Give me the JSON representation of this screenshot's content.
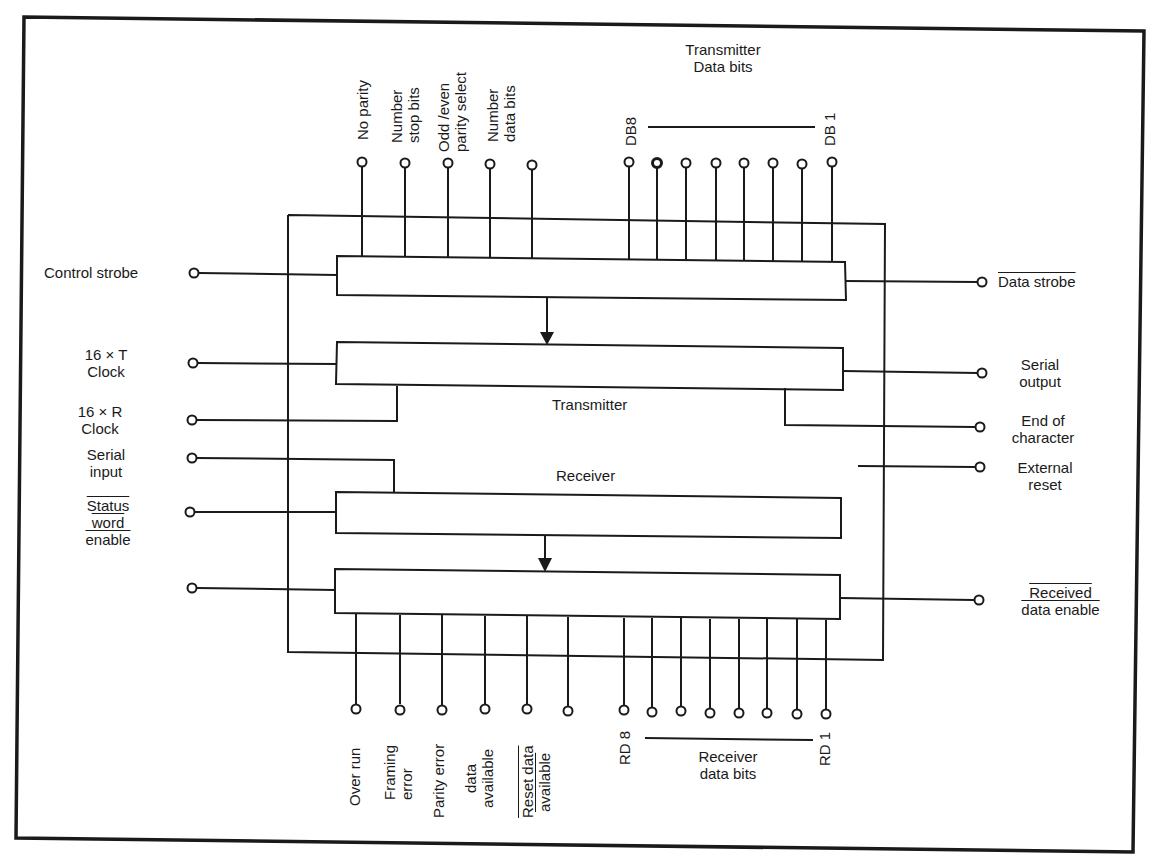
{
  "diagram": {
    "colors": {
      "line": "#1a1a1a",
      "background": "#ffffff"
    },
    "blocks": {
      "transmitter_label": "Transmitter",
      "receiver_label": "Receiver"
    },
    "top_control_pins": [
      {
        "lines": [
          "No parity"
        ]
      },
      {
        "lines": [
          "Number",
          "stop bits"
        ]
      },
      {
        "lines": [
          "Odd /even",
          "parity select"
        ]
      },
      {
        "lines": [
          "Number",
          "data bits"
        ]
      },
      {
        "lines": []
      }
    ],
    "transmitter_data_bits": {
      "title_line1": "Transmitter",
      "title_line2": "Data bits",
      "msb": "DB8",
      "lsb": "DB 1",
      "count": 8
    },
    "left_pins": {
      "control_strobe": "Control strobe",
      "tx_clock_line1": "16  ×  T",
      "tx_clock_line2": "Clock",
      "rx_clock_line1": "16  ×  R",
      "rx_clock_line2": "Clock",
      "serial_input_line1": "Serial",
      "serial_input_line2": "input",
      "status_word_line1": "Status",
      "status_word_line2": "word",
      "status_word_line3": "enable"
    },
    "right_pins": {
      "data_strobe": "Data strobe",
      "serial_output_line1": "Serial",
      "serial_output_line2": "output",
      "end_of_char_line1": "End of",
      "end_of_char_line2": "character",
      "external_reset_line1": "External",
      "external_reset_line2": "reset",
      "received_data_enable_line1": "Received",
      "received_data_enable_line2": "data enable"
    },
    "bottom_status_pins": {
      "over_run": "Over run",
      "framing_error_line1": "Framing",
      "framing_error_line2": "error",
      "parity_error": "Parity error",
      "data_available_line1": "data",
      "data_available_line2": "available",
      "reset_data_available_line1": "Reset data",
      "reset_data_available_line2": "available"
    },
    "receiver_data_bits": {
      "title_line1": "Receiver",
      "title_line2": "data bits",
      "msb": "RD 8",
      "lsb": "RD 1",
      "count": 8
    }
  }
}
